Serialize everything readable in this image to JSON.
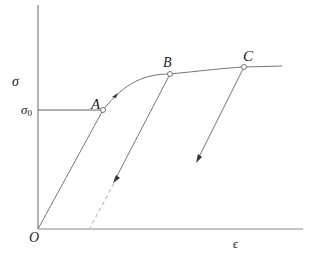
{
  "diagram": {
    "type": "stress-strain curve with unloading paths",
    "axes": {
      "y_label": "σ",
      "x_label": "ϵ",
      "origin_label": "O",
      "yield_label": "σ",
      "yield_subscript": "0"
    },
    "points": [
      {
        "label": "A",
        "x": 103,
        "y": 110
      },
      {
        "label": "B",
        "x": 170,
        "y": 74
      },
      {
        "label": "C",
        "x": 244,
        "y": 67
      }
    ],
    "colors": {
      "line": "#555555",
      "text": "#222222",
      "dashed": "#999999"
    }
  }
}
